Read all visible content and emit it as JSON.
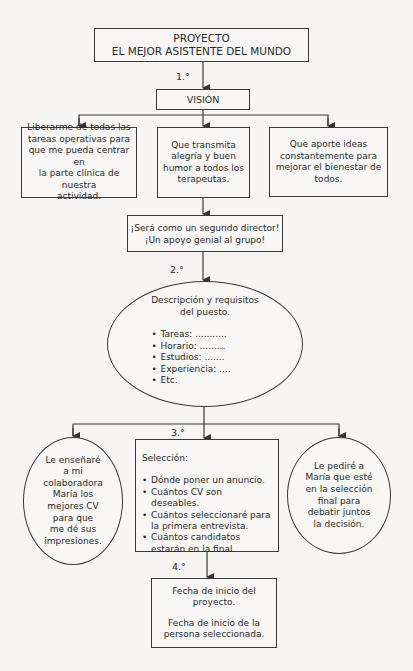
{
  "title_box": {
    "line1": "PROYECTO",
    "line2": "EL MEJOR ASISTENTE DEL MUNDO"
  },
  "steps": {
    "s1": "1.°",
    "s2": "2.°",
    "s3": "3.°",
    "s4": "4.°"
  },
  "vision": {
    "label": "VISIÓN",
    "items": [
      "Liberarme de todas las\ntareas operativas para\nque me pueda centrar en\nla parte clínica de nuestra\nactividad.",
      "Que transmita\nalegría y buen\nhumor a todos los\nterapeutas.",
      "Que aporte ideas\nconstantemente para\nmejorar el bienestar de\ntodos."
    ]
  },
  "summary_box": {
    "line1": "¡Será como un segundo director!",
    "line2": "¡Un apoyo genial al grupo!"
  },
  "job_description": {
    "title": "Descripción y requisitos\ndel puesto.",
    "items": [
      "Tareas: ...........",
      "Horario: .........",
      "Estudios: .......",
      "Experiencia: ....",
      "Etc."
    ]
  },
  "selection": {
    "left_circle": "Le enseñaré\na mi\ncolaboradora\nMaría los\nmejores CV\npara que\nme dé sus\nimpresiones.",
    "center_box": {
      "title": "Selección:",
      "items": [
        "Dónde poner un anuncio.",
        "Cuántos CV son deseables.",
        "Cuántos seleccionaré para la primera entrevista.",
        "Cuántos candidatos estarán en la final."
      ]
    },
    "right_circle": "Le pediré a\nMaría que esté\nen la selección\nfinal para\ndebatir juntos\nla decisión."
  },
  "start_box": {
    "line1": "Fecha de inicio del\nproyecto.",
    "line2": "Fecha de inicio de la\npersona seleccionada."
  },
  "colors": {
    "line": "#3a3a3a",
    "background": "#f6f5f3"
  }
}
